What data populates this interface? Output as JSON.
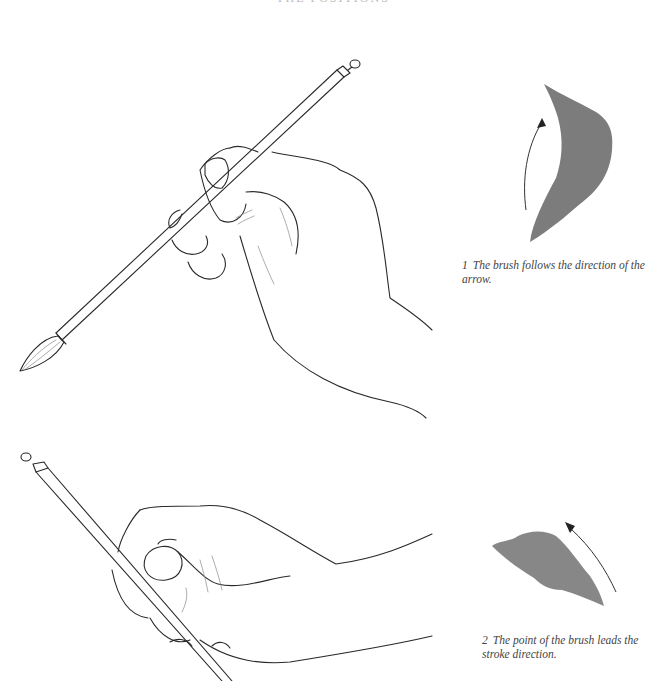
{
  "page": {
    "running_head": "THE POSITIONS"
  },
  "figures": [
    {
      "id": 1,
      "number": "1",
      "caption": "The brush follows the direction of the arrow.",
      "stroke_color": "#6e6e6e",
      "arrow_direction": "upward"
    },
    {
      "id": 2,
      "number": "2",
      "caption": "The point of the brush leads the stroke direction.",
      "stroke_color": "#7a7a7a",
      "arrow_direction": "up-left"
    }
  ]
}
